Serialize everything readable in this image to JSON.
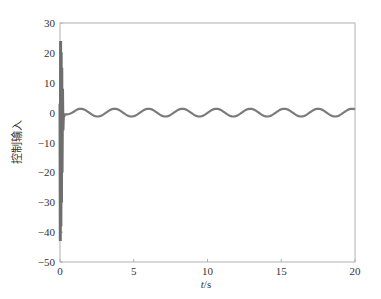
{
  "chart_data": {
    "type": "line",
    "title": "",
    "xlabel": "t/s",
    "xlabel_italic_part": "t",
    "xlabel_unit_part": "/s",
    "ylabel": "控制输入",
    "xlim": [
      0,
      20
    ],
    "ylim": [
      -50,
      30
    ],
    "xticks": [
      0,
      5,
      10,
      15,
      20
    ],
    "yticks": [
      30,
      20,
      10,
      0,
      -10,
      -20,
      -30,
      -40,
      -50
    ],
    "grid": false,
    "legend": null,
    "line_color": "#7a7a7a",
    "axis_color": "#b0b0b0",
    "series": [
      {
        "name": "control input",
        "description": "Large transient at t≈0 (peak ≈ +24, trough ≈ -43), then steady sinusoidal oscillation around ≈0 with amplitude ≈1.3 and period ≈2.3 s",
        "x": [
          0,
          0.02,
          0.05,
          0.08,
          0.1,
          0.13,
          0.16,
          0.2,
          0.25,
          0.3,
          0.4,
          0.6,
          1.0,
          1.4,
          2.0,
          2.5,
          3.2,
          3.8,
          4.3,
          4.9,
          5.5,
          6.1,
          6.6,
          7.2,
          7.8,
          8.4,
          8.9,
          9.5,
          10.1,
          10.7,
          11.2,
          11.8,
          12.4,
          13.0,
          13.5,
          14.1,
          14.7,
          15.3,
          15.8,
          16.4,
          17.0,
          17.6,
          18.1,
          18.7,
          19.3,
          19.9,
          20.0
        ],
        "y": [
          3,
          -43,
          24,
          -30,
          18,
          -20,
          10,
          -6,
          -1,
          -1.3,
          -1.0,
          -0.5,
          0.8,
          1.3,
          0.2,
          -1.3,
          0.1,
          1.3,
          0.1,
          -1.3,
          0.1,
          1.3,
          0.1,
          -1.3,
          0.1,
          1.3,
          0.1,
          -1.3,
          0.1,
          1.3,
          0.1,
          -1.3,
          0.1,
          1.3,
          0.1,
          -1.3,
          0.1,
          1.3,
          0.1,
          -1.3,
          0.1,
          1.3,
          0.1,
          -1.3,
          0.1,
          1.3,
          1.2
        ]
      }
    ],
    "spike": {
      "t": 0.0,
      "max": 24,
      "min": -43,
      "settle_t": 0.3
    },
    "steady_state": {
      "mean": 0,
      "amplitude": 1.3,
      "period": 2.3,
      "start_t": 0.3
    }
  },
  "labels": {
    "xlabel_italic": "t",
    "xlabel_rest": "/s",
    "ylabel": "控制输入",
    "xticks": [
      "0",
      "5",
      "10",
      "15",
      "20"
    ],
    "yticks": [
      "30",
      "20",
      "10",
      "0",
      "−10",
      "−20",
      "−30",
      "−40",
      "−50"
    ]
  }
}
